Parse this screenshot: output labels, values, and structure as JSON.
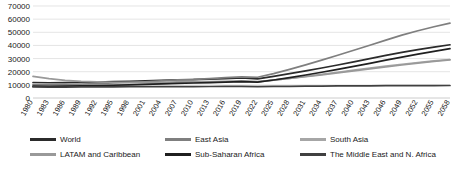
{
  "chart_data": {
    "type": "line",
    "title": "",
    "xlabel": "",
    "ylabel": "",
    "grid": true,
    "legend_position": "bottom",
    "ylim": [
      0,
      70000
    ],
    "ytick_labels": [
      "0",
      "10000",
      "20000",
      "30000",
      "40000",
      "50000",
      "60000",
      "70000"
    ],
    "ytick_values": [
      0,
      10000,
      20000,
      30000,
      40000,
      50000,
      60000,
      70000
    ],
    "categories": [
      "1980",
      "1983",
      "1986",
      "1989",
      "1992",
      "1995",
      "1998",
      "2001",
      "2004",
      "2007",
      "2010",
      "2013",
      "2016",
      "2019",
      "2022",
      "2025",
      "2028",
      "2031",
      "2034",
      "2037",
      "2040",
      "2043",
      "2046",
      "2049",
      "2052",
      "2055",
      "2058"
    ],
    "x": [
      1980,
      1983,
      1986,
      1989,
      1992,
      1995,
      1998,
      2001,
      2004,
      2007,
      2010,
      2013,
      2016,
      2019,
      2022,
      2025,
      2028,
      2031,
      2034,
      2037,
      2040,
      2043,
      2046,
      2049,
      2052,
      2055,
      2058
    ],
    "series": [
      {
        "name": "World",
        "color": "#2b2b2b",
        "values": [
          11800,
          11600,
          11700,
          12000,
          12100,
          12400,
          12700,
          13000,
          13400,
          13900,
          14000,
          14400,
          14800,
          15200,
          14600,
          16500,
          18500,
          20600,
          22800,
          25100,
          27500,
          30000,
          32400,
          34700,
          36800,
          38700,
          40500
        ]
      },
      {
        "name": "East Asia",
        "color": "#7f7f7f",
        "values": [
          10200,
          10000,
          10200,
          10600,
          10900,
          11400,
          11800,
          12300,
          13000,
          13800,
          14200,
          14800,
          15500,
          16100,
          15800,
          18500,
          21800,
          25200,
          28800,
          32500,
          36300,
          40100,
          44000,
          47800,
          51200,
          54200,
          57000
        ]
      },
      {
        "name": "South Asia",
        "color": "#a6a6a6",
        "values": [
          9200,
          9100,
          9200,
          9400,
          9600,
          9900,
          10200,
          10500,
          10900,
          11400,
          11600,
          11900,
          12300,
          12700,
          12300,
          13600,
          15000,
          16500,
          18000,
          19600,
          21200,
          22800,
          24300,
          25700,
          27000,
          28200,
          29300
        ]
      },
      {
        "name": "LATAM and Caribbean",
        "color": "#999999",
        "values": [
          16500,
          14700,
          13400,
          12600,
          12200,
          12000,
          11900,
          11900,
          12000,
          12200,
          12300,
          12500,
          12700,
          13000,
          12500,
          13600,
          14900,
          16200,
          17600,
          19100,
          20600,
          22100,
          23600,
          25100,
          26500,
          27800,
          29000
        ]
      },
      {
        "name": "Sub-Saharan Africa",
        "color": "#1f1f1f",
        "values": [
          9000,
          8900,
          9000,
          9200,
          9400,
          9700,
          10000,
          10300,
          10700,
          11200,
          11400,
          11700,
          12100,
          12500,
          12100,
          13700,
          15500,
          17500,
          19600,
          21800,
          24100,
          26400,
          28800,
          31100,
          33400,
          35500,
          37500
        ]
      },
      {
        "name": "The Middle East and N. Africa",
        "color": "#404040",
        "values": [
          8400,
          8300,
          8350,
          8400,
          8450,
          8500,
          8550,
          8600,
          8650,
          8700,
          8700,
          8750,
          8800,
          8850,
          8600,
          8800,
          8900,
          9000,
          9100,
          9200,
          9250,
          9300,
          9350,
          9400,
          9450,
          9480,
          9500
        ]
      }
    ]
  },
  "legend": {
    "entries": [
      {
        "label": "World"
      },
      {
        "label": "East Asia"
      },
      {
        "label": "South Asia"
      },
      {
        "label": "LATAM and Caribbean"
      },
      {
        "label": "Sub-Saharan Africa"
      },
      {
        "label": "The Middle East and N. Africa"
      }
    ]
  }
}
